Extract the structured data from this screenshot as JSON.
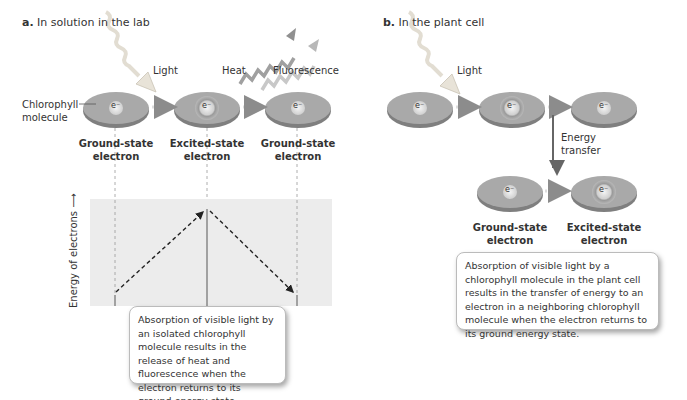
{
  "panel_a": {
    "letter": "a.",
    "title": "In solution in the lab",
    "labels": {
      "light": "Light",
      "heat": "Heat",
      "fluorescence": "Fluorescence",
      "chlorophyll_line1": "Chlorophyll",
      "chlorophyll_line2": "molecule"
    },
    "molecules": [
      {
        "state": "ground",
        "electron": "e⁻",
        "label_line1": "Ground-state",
        "label_line2": "electron"
      },
      {
        "state": "excited",
        "electron": "e⁻",
        "label_line1": "Excited-state",
        "label_line2": "electron"
      },
      {
        "state": "ground",
        "electron": "e⁻",
        "label_line1": "Ground-state",
        "label_line2": "electron"
      }
    ],
    "energy_axis_label": "Energy of electrons ⟶",
    "caption": "Absorption of visible light by an isolated chlorophyll molecule results in the release of heat and fluorescence when the electron returns to its ground energy state."
  },
  "panel_b": {
    "letter": "b.",
    "title": "In the plant cell",
    "labels": {
      "light": "Light",
      "energy_transfer_line1": "Energy",
      "energy_transfer_line2": "transfer"
    },
    "top_molecules": [
      {
        "state": "ground",
        "electron": "e⁻"
      },
      {
        "state": "excited",
        "electron": "e⁻"
      },
      {
        "state": "ground",
        "electron": "e⁻"
      }
    ],
    "bottom_molecules": [
      {
        "state": "ground",
        "electron": "e⁻",
        "label_line1": "Ground-state",
        "label_line2": "electron"
      },
      {
        "state": "excited",
        "electron": "e⁻",
        "label_line1": "Excited-state",
        "label_line2": "electron"
      }
    ],
    "caption": "Absorption of visible light by a chlorophyll molecule in the plant cell results in the transfer of energy to an electron in a neighboring chlorophyll molecule when the electron returns to its ground energy state."
  },
  "colors": {
    "molecule_top": "#a9a9a9",
    "molecule_rim": "#7f7f7f",
    "arrow_gray": "#8c8c8c",
    "energy_band": "#ececec"
  }
}
